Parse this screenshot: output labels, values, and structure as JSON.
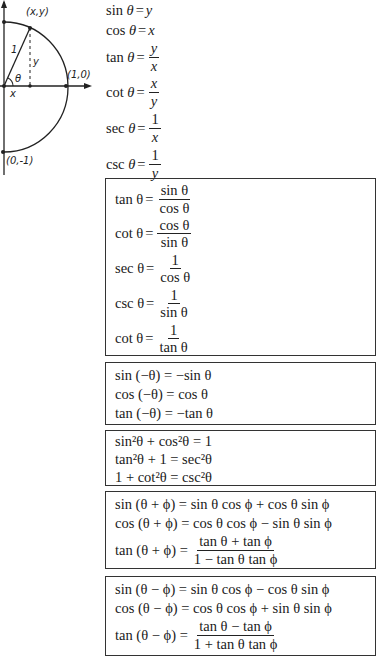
{
  "diagram": {
    "labels": {
      "point": "(x,y)",
      "unit_x": "(1,0)",
      "unit_neg_y": "(0,-1)",
      "hyp": "1",
      "opp": "y",
      "adj": "x",
      "angle": "θ"
    }
  },
  "definitions": [
    {
      "fn": "sin",
      "arg": "θ",
      "rhs": "y"
    },
    {
      "fn": "cos",
      "arg": "θ",
      "rhs": "x"
    },
    {
      "fn": "tan",
      "arg": "θ",
      "num": "y",
      "den": "x"
    },
    {
      "fn": "cot",
      "arg": "θ",
      "num": "x",
      "den": "y"
    },
    {
      "fn": "sec",
      "arg": "θ",
      "num": "1",
      "den": "x"
    },
    {
      "fn": "csc",
      "arg": "θ",
      "num": "1",
      "den": "y"
    }
  ],
  "quotient_reciprocal": [
    {
      "lhs": "tan θ",
      "num": "sin θ",
      "den": "cos θ"
    },
    {
      "lhs": "cot θ",
      "num": "cos θ",
      "den": "sin θ"
    },
    {
      "lhs": "sec θ",
      "num": "1",
      "den": "cos θ"
    },
    {
      "lhs": "csc θ",
      "num": "1",
      "den": "sin θ"
    },
    {
      "lhs": "cot θ",
      "num": "1",
      "den": "tan θ"
    }
  ],
  "negative_angle": [
    {
      "text": "sin (−θ) = −sin θ"
    },
    {
      "text": "cos (−θ) = cos θ"
    },
    {
      "text": "tan (−θ) = −tan θ"
    }
  ],
  "pythagorean": [
    {
      "text": "sin²θ + cos²θ = 1"
    },
    {
      "text": "tan²θ + 1 = sec²θ"
    },
    {
      "text": "1 + cot²θ = csc²θ"
    }
  ],
  "sum_formulas": [
    {
      "text": "sin (θ + ϕ) = sin θ cos ϕ + cos θ sin ϕ"
    },
    {
      "text": "cos (θ + ϕ) = cos θ cos ϕ − sin θ sin ϕ"
    },
    {
      "lhs": "tan (θ + ϕ) =",
      "num": "tan θ + tan ϕ",
      "den": "1 − tan θ tan ϕ"
    }
  ],
  "difference_formulas": [
    {
      "text": "sin (θ − ϕ) = sin θ cos ϕ − cos θ sin ϕ"
    },
    {
      "text": "cos (θ − ϕ) = cos θ cos ϕ + sin θ sin ϕ"
    },
    {
      "lhs": "tan (θ − ϕ) =",
      "num": "tan θ − tan ϕ",
      "den": "1 + tan θ tan ϕ"
    }
  ]
}
